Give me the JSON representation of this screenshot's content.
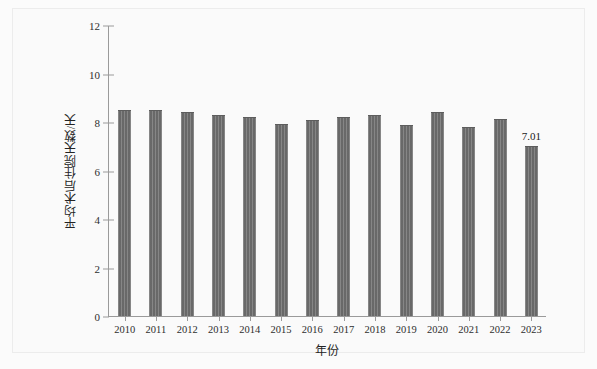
{
  "chart_data": {
    "type": "bar",
    "title": "",
    "xlabel": "年份",
    "ylabel": "平均术后住院天数/天",
    "categories": [
      "2010",
      "2011",
      "2012",
      "2013",
      "2014",
      "2015",
      "2016",
      "2017",
      "2018",
      "2019",
      "2020",
      "2021",
      "2022",
      "2023"
    ],
    "values": [
      8.5,
      8.5,
      8.4,
      8.3,
      8.2,
      7.9,
      8.1,
      8.2,
      8.3,
      7.88,
      8.4,
      7.8,
      8.12,
      7.01
    ],
    "ylim": [
      0,
      12
    ],
    "ytick_labels": [
      "0",
      "2",
      "4",
      "6",
      "8",
      "10",
      "12"
    ],
    "ytick_values": [
      0,
      2,
      4,
      6,
      8,
      10,
      12
    ],
    "grid": false,
    "legend": "none",
    "annotations": [
      {
        "category": "2023",
        "text": "7.01",
        "value": 7.01
      }
    ],
    "bar_color": "#6f6f6f"
  }
}
